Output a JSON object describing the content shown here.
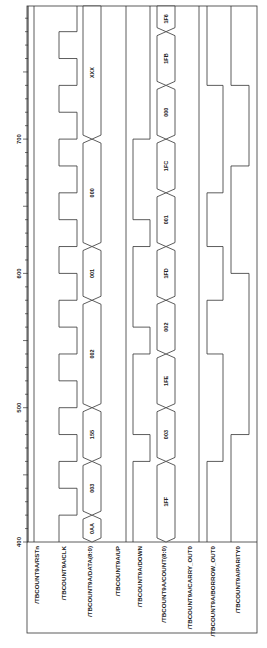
{
  "diagram": {
    "type": "timing-waveform",
    "orientation": "rotated-90-ccw",
    "time_axis": {
      "ticks": [
        {
          "label": "400",
          "t": 400
        },
        {
          "label": "500",
          "t": 500
        },
        {
          "label": "600",
          "t": 600
        },
        {
          "label": "700",
          "t": 700
        }
      ],
      "range": [
        400,
        800
      ],
      "minor_tick_step": 10
    },
    "signals": [
      {
        "name": "/TBCOUNT9A/RSTn",
        "kind": "bit",
        "edges": [],
        "init": 1
      },
      {
        "name": "/TBCOUNT9A/CLK",
        "kind": "clock",
        "period": 40,
        "first_rise": 420,
        "init": 0
      },
      {
        "name": "/TBCOUNT9A/DATA(8:0)",
        "kind": "bus",
        "segments": [
          {
            "from": 400,
            "to": 420,
            "value": "0AA"
          },
          {
            "from": 420,
            "to": 460,
            "value": "003"
          },
          {
            "from": 460,
            "to": 500,
            "value": "155"
          },
          {
            "from": 500,
            "to": 580,
            "value": "002"
          },
          {
            "from": 580,
            "to": 620,
            "value": "001"
          },
          {
            "from": 620,
            "to": 700,
            "value": "000"
          },
          {
            "from": 700,
            "to": 800,
            "value": "XXX"
          }
        ]
      },
      {
        "name": "/TBCOUNT9A/UP",
        "kind": "bit",
        "edges": [],
        "init": 0
      },
      {
        "name": "/TBCOUNT9A/DOWN",
        "kind": "bit",
        "init": 0,
        "edges": [
          460,
          480,
          540,
          560,
          620,
          640,
          700
        ]
      },
      {
        "name": "/TBCOUNT9A/COUNT(8:0)",
        "kind": "bus",
        "segments": [
          {
            "from": 400,
            "to": 460,
            "value": "1FF"
          },
          {
            "from": 460,
            "to": 500,
            "value": "003"
          },
          {
            "from": 500,
            "to": 540,
            "value": "1FE"
          },
          {
            "from": 540,
            "to": 580,
            "value": "002"
          },
          {
            "from": 580,
            "to": 620,
            "value": "1FD"
          },
          {
            "from": 620,
            "to": 660,
            "value": "001"
          },
          {
            "from": 660,
            "to": 700,
            "value": "1FC"
          },
          {
            "from": 700,
            "to": 740,
            "value": "000"
          },
          {
            "from": 740,
            "to": 780,
            "value": "1FB"
          },
          {
            "from": 780,
            "to": 800,
            "value": "1F6"
          }
        ]
      },
      {
        "name": "/TBCOUNT9A/CARRY_OUT0",
        "kind": "bit",
        "edges": [],
        "init": 0
      },
      {
        "name": "/TBCOUNT9A/BORROW_OUT0",
        "kind": "bit",
        "init": 0,
        "edges": [
          460,
          540,
          580,
          620,
          660,
          740
        ]
      },
      {
        "name": "/TBCOUNT9A/PARITY0",
        "kind": "bit",
        "init": 0,
        "edges": [
          480,
          600,
          680,
          740
        ]
      }
    ]
  }
}
